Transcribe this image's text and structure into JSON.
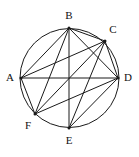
{
  "figure": {
    "canvas": {
      "width": 139,
      "height": 157
    },
    "stroke_color": "#1a1a1a",
    "label_color": "#111111",
    "background_color": "#ffffff",
    "circle": {
      "cx": 69.5,
      "cy": 78,
      "r": 49.5
    },
    "vertices": [
      {
        "id": "A",
        "label": "A",
        "x": 21,
        "y": 78,
        "label_x": 10,
        "label_y": 78
      },
      {
        "id": "B",
        "label": "B",
        "x": 69,
        "y": 28,
        "label_x": 69,
        "label_y": 16
      },
      {
        "id": "C",
        "label": "C",
        "x": 105,
        "y": 41,
        "label_x": 113,
        "label_y": 30
      },
      {
        "id": "D",
        "label": "D",
        "x": 118,
        "y": 78,
        "label_x": 128,
        "label_y": 78
      },
      {
        "id": "E",
        "label": "E",
        "x": 69,
        "y": 128,
        "label_x": 69,
        "label_y": 141
      },
      {
        "id": "F",
        "label": "F",
        "x": 35,
        "y": 114,
        "label_x": 28,
        "label_y": 126
      }
    ],
    "chords": [
      {
        "from": "A",
        "to": "B"
      },
      {
        "from": "A",
        "to": "C"
      },
      {
        "from": "A",
        "to": "D"
      },
      {
        "from": "A",
        "to": "F"
      },
      {
        "from": "B",
        "to": "C"
      },
      {
        "from": "B",
        "to": "D"
      },
      {
        "from": "B",
        "to": "E"
      },
      {
        "from": "B",
        "to": "F"
      },
      {
        "from": "C",
        "to": "D"
      },
      {
        "from": "C",
        "to": "E"
      },
      {
        "from": "C",
        "to": "F"
      },
      {
        "from": "D",
        "to": "E"
      },
      {
        "from": "D",
        "to": "F"
      }
    ]
  }
}
